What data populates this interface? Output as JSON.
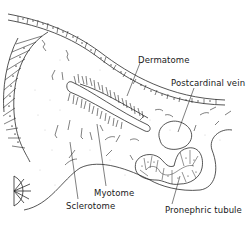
{
  "diagram": {
    "type": "anatomical-cross-section",
    "labels": {
      "dermatome": "Dermatome",
      "postcardinal_vein": "Postcardinal vein",
      "myotome": "Myotome",
      "sclerotome": "Sclerotome",
      "pronephric_tubule": "Pronephric tubule"
    },
    "colors": {
      "line": "#2a2a2a",
      "background": "#ffffff",
      "stipple": "#9a9a9a"
    }
  }
}
